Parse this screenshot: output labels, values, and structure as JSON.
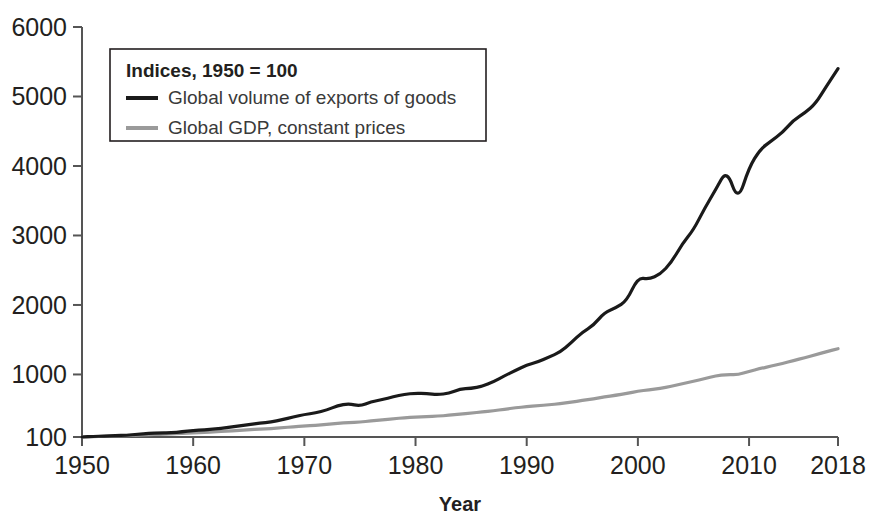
{
  "chart_data": {
    "type": "line",
    "title": "",
    "xlabel": "Year",
    "ylabel": "",
    "legend_title": "Indices, 1950 = 100",
    "legend_position": "top-left",
    "grid": false,
    "xlim": [
      1950,
      2018
    ],
    "ylim": [
      100,
      6000
    ],
    "xticks": [
      1950,
      1960,
      1970,
      1980,
      1990,
      2000,
      2010,
      2018
    ],
    "xtick_labels": [
      "1950",
      "1960",
      "1970",
      "1980",
      "1990",
      "2000",
      "2010",
      "2018"
    ],
    "yticks": [
      100,
      1000,
      2000,
      3000,
      4000,
      5000,
      6000
    ],
    "ytick_labels": [
      "100",
      "1000",
      "2000",
      "3000",
      "4000",
      "5000",
      "6000"
    ],
    "x": [
      1950,
      1951,
      1952,
      1953,
      1954,
      1955,
      1956,
      1957,
      1958,
      1959,
      1960,
      1961,
      1962,
      1963,
      1964,
      1965,
      1966,
      1967,
      1968,
      1969,
      1970,
      1971,
      1972,
      1973,
      1974,
      1975,
      1976,
      1977,
      1978,
      1979,
      1980,
      1981,
      1982,
      1983,
      1984,
      1985,
      1986,
      1987,
      1988,
      1989,
      1990,
      1991,
      1992,
      1993,
      1994,
      1995,
      1996,
      1997,
      1998,
      1999,
      2000,
      2001,
      2002,
      2003,
      2004,
      2005,
      2006,
      2007,
      2008,
      2009,
      2010,
      2011,
      2012,
      2013,
      2014,
      2015,
      2016,
      2017,
      2018
    ],
    "series": [
      {
        "name": "Global volume of exports of goods",
        "color": "#1a1a1a",
        "width": 3.2,
        "values": [
          100,
          110,
          112,
          118,
          126,
          139,
          152,
          161,
          160,
          175,
          194,
          203,
          216,
          233,
          258,
          279,
          300,
          314,
          349,
          388,
          424,
          446,
          487,
          551,
          580,
          545,
          607,
          637,
          678,
          715,
          730,
          724,
          708,
          730,
          790,
          800,
          830,
          895,
          980,
          1060,
          1135,
          1180,
          1250,
          1320,
          1455,
          1610,
          1705,
          1895,
          1955,
          2060,
          2395,
          2370,
          2440,
          2610,
          2880,
          3080,
          3390,
          3660,
          3950,
          3490,
          3980,
          4240,
          4360,
          4480,
          4660,
          4760,
          4900,
          5160,
          5400
        ]
      },
      {
        "name": "Global GDP, constant prices",
        "color": "#9a9a9a",
        "width": 3.2,
        "values": [
          100,
          105,
          110,
          116,
          120,
          128,
          134,
          140,
          144,
          152,
          160,
          167,
          175,
          183,
          194,
          204,
          214,
          222,
          234,
          247,
          258,
          268,
          281,
          298,
          308,
          315,
          331,
          345,
          361,
          378,
          387,
          394,
          400,
          412,
          430,
          445,
          460,
          478,
          500,
          520,
          537,
          550,
          563,
          580,
          602,
          625,
          650,
          678,
          700,
          726,
          760,
          778,
          800,
          828,
          868,
          900,
          940,
          980,
          1000,
          995,
          1045,
          1085,
          1120,
          1158,
          1200,
          1240,
          1285,
          1330,
          1370
        ]
      }
    ],
    "annotations": [
      {
        "year": 1975,
        "label": "oil-crisis dip in export volume"
      },
      {
        "year": 2009,
        "label": "global financial crisis collapse in trade"
      }
    ]
  },
  "legend": {
    "title": "Indices, 1950 = 100",
    "entries": [
      {
        "label": "Global volume of exports of goods",
        "color": "#1a1a1a"
      },
      {
        "label": "Global GDP, constant prices",
        "color": "#9a9a9a"
      }
    ]
  },
  "axis": {
    "x_title": "Year"
  }
}
